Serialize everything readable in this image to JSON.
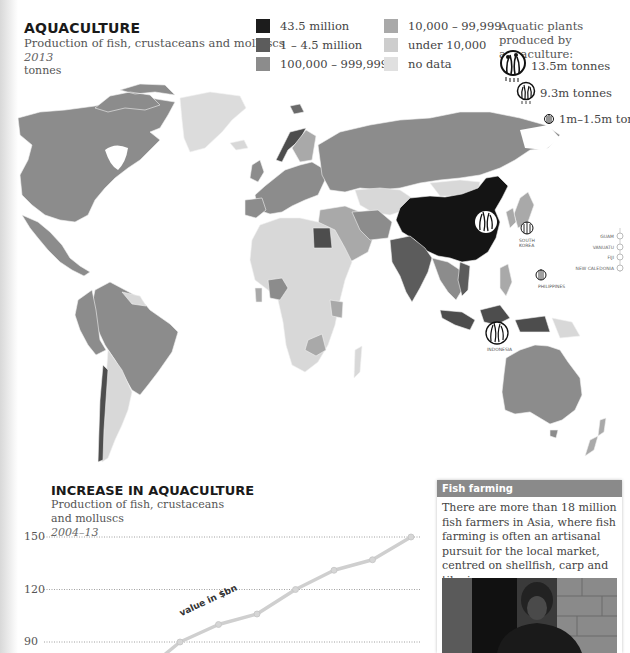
{
  "header": {
    "title": "AQUACULTURE",
    "subtitle": "Production of fish, crustaceans and molluscs",
    "year": "2013",
    "unit": "tonnes"
  },
  "legend": {
    "items": [
      {
        "label": "43.5 million",
        "color": "#1c1c1c"
      },
      {
        "label": "1 – 4.5 million",
        "color": "#5c5c5c"
      },
      {
        "label": "100,000 – 999,999",
        "color": "#8c8c8c"
      },
      {
        "label": "10,000 – 99,999",
        "color": "#a9a9a9"
      },
      {
        "label": "under 10,000",
        "color": "#cdcdcd"
      },
      {
        "label": "no data",
        "color": "#e0e0e0"
      }
    ]
  },
  "aquatic_plants": {
    "title": "Aquatic plants produced by aquaculture:",
    "items": [
      {
        "label": "13.5m tonnes",
        "icon": "seaweed-large-icon"
      },
      {
        "label": "9.3m tonnes",
        "icon": "seaweed-medium-icon"
      },
      {
        "label": "1m–1.5m tonnes",
        "icon": "seaweed-small-icon"
      }
    ]
  },
  "map": {
    "labels": {
      "south_korea": "SOUTH KOREA",
      "philippines": "PHILIPPINES",
      "indonesia": "INDONESIA",
      "guam": "GUAM",
      "vanuatu": "VANUATU",
      "fiji": "FIJI",
      "new_caledonia": "NEW CALEDONIA"
    }
  },
  "chart_section": {
    "title": "INCREASE IN AQUACULTURE",
    "subtitle_line1": "Production of fish, crustaceans",
    "subtitle_line2": "and molluscs",
    "period": "2004–13",
    "series_label": "value in $bn"
  },
  "chart_data": {
    "type": "line",
    "title": "INCREASE IN AQUACULTURE",
    "subtitle": "Production of fish, crustaceans and molluscs 2004–13",
    "xlabel": "",
    "ylabel": "value in $bn",
    "y_ticks": [
      90,
      120,
      150
    ],
    "ylim": [
      80,
      155
    ],
    "grid": true,
    "legend": "none",
    "x_visible_points": [
      "2007",
      "2008",
      "2009",
      "2010",
      "2011",
      "2012",
      "2013"
    ],
    "series": [
      {
        "name": "value in $bn",
        "values": [
          90,
          100,
          106,
          120,
          131,
          137,
          150
        ]
      }
    ],
    "note": "Earlier years (2004–06) are cropped below the visible area"
  },
  "sidebox": {
    "header": "Fish farming",
    "body": "There are more than 18 million fish farmers in Asia, where fish farming is often an artisanal pursuit for the local market, centred on shellfish, carp and tilapia."
  }
}
